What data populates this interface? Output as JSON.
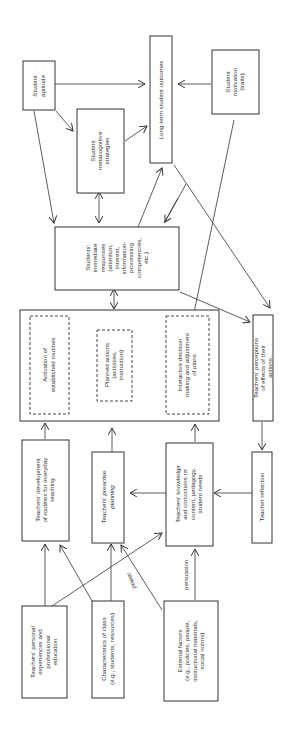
{
  "diagram": {
    "orientation": "rotated 90deg counterclockwise",
    "nodes": {
      "student_aptitude": [
        "Student",
        "aptitude"
      ],
      "student_metacognitive": [
        "Student",
        "metacognitive",
        "strategies"
      ],
      "long_term_outcomes": [
        "Long-term student outcomes"
      ],
      "student_motivation": [
        "Student",
        "motivation",
        "(traits)"
      ],
      "students_immediate": [
        "Students'",
        "immediate",
        "responses",
        "(attention,",
        "interest,",
        "information-",
        "processing",
        "competencies,",
        "etc.)"
      ],
      "activation_routines": [
        "Activation of",
        "established routines"
      ],
      "planned_actions": [
        "Planned actions",
        "(activities,",
        "instruction)"
      ],
      "interactive_decision": [
        "Interactive decision",
        "making and adjustment",
        "of plans"
      ],
      "teachers_perceptions": [
        "Teachers' perceptions",
        "of effects of their",
        "actions"
      ],
      "teachers_routines": [
        "Teachers' development",
        "of routines for everyday",
        "teaching"
      ],
      "teachers_preactive": [
        "Teachers' preactive",
        "planning"
      ],
      "teachers_knowledge": [
        "Teachers' knowledge",
        "and convictions re:",
        "content, pedagogy,",
        "student needs"
      ],
      "teacher_reflection": [
        "Teacher reflection"
      ],
      "teachers_personal": [
        "Teachers' personal",
        "experiences and",
        "professional",
        "education"
      ],
      "characteristics_class": [
        "Characteristics of class",
        "(e.g., students, resources)"
      ],
      "external_factors": [
        "External factors",
        "(e.g., policies, people,",
        "instructional materials,",
        "social norms)"
      ]
    },
    "edge_labels": {
      "power": "power",
      "persuasion": "persuasion"
    }
  }
}
